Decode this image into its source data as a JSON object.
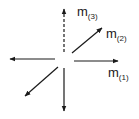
{
  "diagram": {
    "type": "vector-diagram",
    "stroke_color": "#1a1a1a",
    "background": "#ffffff",
    "vectors": [
      {
        "id": "m3",
        "direction": "up",
        "style": "dashed",
        "label": "m",
        "subscript": "(3)"
      },
      {
        "id": "m2",
        "direction": "up-right",
        "style": "solid",
        "label": "m",
        "subscript": "(2)"
      },
      {
        "id": "m1",
        "direction": "right",
        "style": "solid",
        "label": "m",
        "subscript": "(1)"
      },
      {
        "id": "left",
        "direction": "left",
        "style": "solid",
        "label": ""
      },
      {
        "id": "down-left",
        "direction": "down-left",
        "style": "solid",
        "label": ""
      },
      {
        "id": "down",
        "direction": "down",
        "style": "solid",
        "label": ""
      }
    ]
  },
  "labels": {
    "m3": {
      "base": "m",
      "sub": "(3)"
    },
    "m2": {
      "base": "m",
      "sub": "(2)"
    },
    "m1": {
      "base": "m",
      "sub": "(1)"
    }
  }
}
